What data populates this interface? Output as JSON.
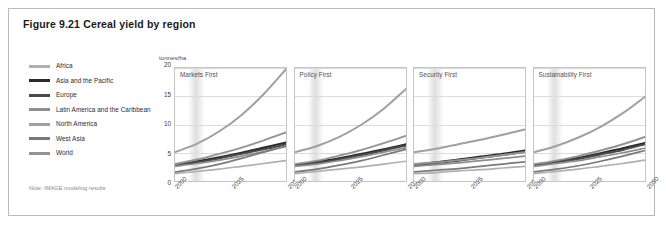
{
  "figure": {
    "title": "Figure 9.21 Cereal yield by region",
    "note": "Note: IMAGE modeling results"
  },
  "legend": {
    "items": [
      {
        "label": "Africa",
        "color": "#b0b0b0"
      },
      {
        "label": "Asia and the Pacific",
        "color": "#2b2b2b"
      },
      {
        "label": "Europe",
        "color": "#4a4a4a"
      },
      {
        "label": "Latin America and the Caribbean",
        "color": "#8e8e8e"
      },
      {
        "label": "North America",
        "color": "#a0a0a0"
      },
      {
        "label": "West Asia",
        "color": "#7a7a7a"
      },
      {
        "label": "World",
        "color": "#949494"
      }
    ]
  },
  "chart_data": {
    "type": "line",
    "title": "Figure 9.21 Cereal yield by region",
    "xlabel": "",
    "ylabel": "tonnes/ha",
    "ylim": [
      0,
      20
    ],
    "yticks": [
      0,
      5,
      10,
      15,
      20
    ],
    "xlim": [
      2000,
      2050
    ],
    "xticks": [
      2000,
      2025,
      2050
    ],
    "xtick_labels": [
      "2000",
      "2025",
      "2050"
    ],
    "grid": true,
    "legend_position": "left",
    "x": [
      2000,
      2010,
      2020,
      2030,
      2040,
      2050
    ],
    "panels": [
      {
        "name": "Markets First",
        "series": [
          {
            "name": "Africa",
            "color": "#b0b0b0",
            "width": 1.7,
            "values": [
              1.3,
              1.7,
              2.1,
              2.6,
              3.1,
              3.6
            ]
          },
          {
            "name": "Asia and the Pacific",
            "color": "#2b2b2b",
            "width": 2.2,
            "values": [
              2.9,
              3.5,
              4.2,
              5.0,
              5.9,
              6.8
            ]
          },
          {
            "name": "Europe",
            "color": "#4a4a4a",
            "width": 2.0,
            "values": [
              2.7,
              3.3,
              4.0,
              4.8,
              5.6,
              6.5
            ]
          },
          {
            "name": "Latin America and the Caribbean",
            "color": "#8e8e8e",
            "width": 1.7,
            "values": [
              2.6,
              3.1,
              3.7,
              4.4,
              5.2,
              6.1
            ]
          },
          {
            "name": "North America",
            "color": "#a0a0a0",
            "width": 2.0,
            "values": [
              5.1,
              6.6,
              8.8,
              11.7,
              15.4,
              19.8
            ]
          },
          {
            "name": "West Asia",
            "color": "#7a7a7a",
            "width": 1.7,
            "values": [
              1.6,
              2.2,
              3.0,
              4.0,
              5.1,
              6.2
            ]
          },
          {
            "name": "World",
            "color": "#949494",
            "width": 1.9,
            "values": [
              3.0,
              3.8,
              4.8,
              5.9,
              7.2,
              8.6
            ]
          }
        ]
      },
      {
        "name": "Policy First",
        "series": [
          {
            "name": "Africa",
            "color": "#b0b0b0",
            "width": 1.7,
            "values": [
              1.3,
              1.7,
              2.1,
              2.5,
              3.0,
              3.5
            ]
          },
          {
            "name": "Asia and the Pacific",
            "color": "#2b2b2b",
            "width": 2.2,
            "values": [
              2.9,
              3.4,
              4.0,
              4.8,
              5.6,
              6.5
            ]
          },
          {
            "name": "Europe",
            "color": "#4a4a4a",
            "width": 2.0,
            "values": [
              2.7,
              3.2,
              3.8,
              4.6,
              5.4,
              6.3
            ]
          },
          {
            "name": "Latin America and the Caribbean",
            "color": "#8e8e8e",
            "width": 1.7,
            "values": [
              2.6,
              3.0,
              3.6,
              4.3,
              5.1,
              5.9
            ]
          },
          {
            "name": "North America",
            "color": "#a0a0a0",
            "width": 2.0,
            "values": [
              5.1,
              6.2,
              7.8,
              10.0,
              12.8,
              16.3
            ]
          },
          {
            "name": "West Asia",
            "color": "#7a7a7a",
            "width": 1.7,
            "values": [
              1.6,
              2.1,
              2.8,
              3.6,
              4.6,
              5.6
            ]
          },
          {
            "name": "World",
            "color": "#949494",
            "width": 1.9,
            "values": [
              3.0,
              3.6,
              4.5,
              5.5,
              6.7,
              8.0
            ]
          }
        ]
      },
      {
        "name": "Security First",
        "series": [
          {
            "name": "Africa",
            "color": "#b0b0b0",
            "width": 1.7,
            "values": [
              1.3,
              1.5,
              1.8,
              2.0,
              2.3,
              2.6
            ]
          },
          {
            "name": "Asia and the Pacific",
            "color": "#2b2b2b",
            "width": 2.2,
            "values": [
              2.9,
              3.3,
              3.8,
              4.3,
              4.8,
              5.4
            ]
          },
          {
            "name": "Europe",
            "color": "#4a4a4a",
            "width": 2.0,
            "values": [
              2.7,
              3.1,
              3.6,
              4.1,
              4.6,
              5.2
            ]
          },
          {
            "name": "Latin America and the Caribbean",
            "color": "#8e8e8e",
            "width": 1.7,
            "values": [
              2.6,
              2.9,
              3.2,
              3.6,
              4.0,
              4.4
            ]
          },
          {
            "name": "North America",
            "color": "#a0a0a0",
            "width": 2.0,
            "values": [
              5.1,
              5.7,
              6.5,
              7.3,
              8.2,
              9.1
            ]
          },
          {
            "name": "West Asia",
            "color": "#7a7a7a",
            "width": 1.7,
            "values": [
              1.6,
              1.9,
              2.2,
              2.6,
              3.0,
              3.4
            ]
          },
          {
            "name": "World",
            "color": "#949494",
            "width": 1.9,
            "values": [
              3.0,
              3.3,
              3.7,
              4.1,
              4.6,
              5.1
            ]
          }
        ]
      },
      {
        "name": "Sustainability First",
        "series": [
          {
            "name": "Africa",
            "color": "#b0b0b0",
            "width": 1.7,
            "values": [
              1.3,
              1.7,
              2.1,
              2.6,
              3.1,
              3.7
            ]
          },
          {
            "name": "Asia and the Pacific",
            "color": "#2b2b2b",
            "width": 2.2,
            "values": [
              2.9,
              3.4,
              4.1,
              4.9,
              5.8,
              6.7
            ]
          },
          {
            "name": "Europe",
            "color": "#4a4a4a",
            "width": 2.0,
            "values": [
              2.7,
              3.3,
              3.9,
              4.7,
              5.5,
              6.5
            ]
          },
          {
            "name": "Latin America and the Caribbean",
            "color": "#8e8e8e",
            "width": 1.7,
            "values": [
              2.6,
              3.1,
              3.6,
              4.3,
              5.0,
              5.8
            ]
          },
          {
            "name": "North America",
            "color": "#a0a0a0",
            "width": 2.0,
            "values": [
              5.1,
              6.2,
              7.7,
              9.6,
              12.0,
              14.9
            ]
          },
          {
            "name": "West Asia",
            "color": "#7a7a7a",
            "width": 1.7,
            "values": [
              1.6,
              2.1,
              2.7,
              3.5,
              4.4,
              5.4
            ]
          },
          {
            "name": "World",
            "color": "#949494",
            "width": 1.9,
            "values": [
              3.0,
              3.6,
              4.4,
              5.4,
              6.5,
              7.8
            ]
          }
        ]
      }
    ]
  }
}
